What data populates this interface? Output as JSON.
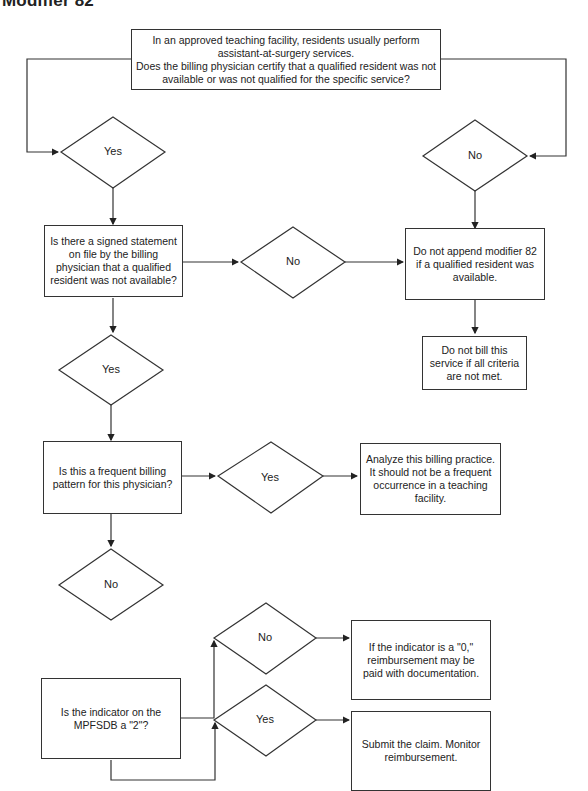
{
  "title": "Modifier 82",
  "nodes": {
    "start": "In an approved teaching facility, residents usually perform assistant-at-surgery services.\nDoes the billing physician certify that a qualified resident was not available or was not qualified for the specific service?",
    "d1_yes": "Yes",
    "d1_no": "No",
    "q_signed": "Is there a signed statement on file by the billing physician that a qualified resident was not available?",
    "d2_no": "No",
    "do_not_append": "Do not append modifier 82 if a qualified resident was available.",
    "do_not_bill": "Do not bill this service if all criteria are not met.",
    "d2_yes": "Yes",
    "q_frequent": "Is this a frequent billing pattern for this physician?",
    "d3_yes": "Yes",
    "analyze": "Analyze this billing practice. It should not be a frequent occurrence in a teaching facility.",
    "d3_no": "No",
    "q_indicator": "Is the indicator on the MPFSDB a \"2\"?",
    "d4_no": "No",
    "indicator_zero": "If the indicator is a \"0,\" reimbursement may be paid with documentation.",
    "d4_yes": "Yes",
    "submit": "Submit the claim. Monitor reimbursement."
  }
}
